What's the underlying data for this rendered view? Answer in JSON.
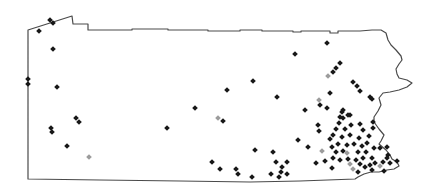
{
  "figure": {
    "type": "dot-distribution-map",
    "region_name": "pennsylvania",
    "background_color": "#ffffff",
    "outline_color": "#4a4a4a",
    "outline_stroke_width": 1.2,
    "marker_shape": "diamond",
    "marker_size": 5.6,
    "marker_colors": {
      "b": "#171717",
      "g": "#9c9c9c"
    },
    "outline": [
      [
        28,
        30
      ],
      [
        72,
        16
      ],
      [
        73,
        24
      ],
      [
        88,
        24
      ],
      [
        88,
        30
      ],
      [
        132,
        30
      ],
      [
        132,
        29
      ],
      [
        168,
        29
      ],
      [
        168,
        30
      ],
      [
        208,
        30
      ],
      [
        208,
        31
      ],
      [
        240,
        31
      ],
      [
        240,
        30
      ],
      [
        262,
        30
      ],
      [
        262,
        31
      ],
      [
        293,
        31
      ],
      [
        293,
        32
      ],
      [
        301,
        32
      ],
      [
        301,
        31
      ],
      [
        330,
        31
      ],
      [
        330,
        33
      ],
      [
        338,
        33
      ],
      [
        338,
        31
      ],
      [
        360,
        31
      ],
      [
        372,
        30
      ],
      [
        381,
        30
      ],
      [
        386,
        33
      ],
      [
        388,
        40
      ],
      [
        391,
        45
      ],
      [
        396,
        50
      ],
      [
        401,
        56
      ],
      [
        402,
        60
      ],
      [
        399,
        64
      ],
      [
        396,
        69
      ],
      [
        397,
        74
      ],
      [
        399,
        78
      ],
      [
        407,
        80
      ],
      [
        412,
        83
      ],
      [
        407,
        87
      ],
      [
        399,
        90
      ],
      [
        390,
        92
      ],
      [
        383,
        93
      ],
      [
        379,
        98
      ],
      [
        381,
        105
      ],
      [
        378,
        111
      ],
      [
        374,
        117
      ],
      [
        374,
        122
      ],
      [
        379,
        129
      ],
      [
        384,
        135
      ],
      [
        381,
        141
      ],
      [
        379,
        144
      ],
      [
        386,
        150
      ],
      [
        390,
        155
      ],
      [
        392,
        159
      ],
      [
        397,
        162
      ],
      [
        399,
        166
      ],
      [
        394,
        169
      ],
      [
        387,
        170
      ],
      [
        379,
        172
      ],
      [
        371,
        172
      ],
      [
        364,
        174
      ],
      [
        358,
        177
      ],
      [
        355,
        179
      ],
      [
        300,
        181
      ],
      [
        250,
        182
      ],
      [
        180,
        181
      ],
      [
        100,
        180
      ],
      [
        28,
        179
      ]
    ],
    "markers": [
      [
        50,
        20,
        "b"
      ],
      [
        53,
        23,
        "b"
      ],
      [
        39,
        31,
        "b"
      ],
      [
        53,
        49,
        "b"
      ],
      [
        28,
        79,
        "b"
      ],
      [
        28,
        84,
        "b"
      ],
      [
        57,
        87,
        "b"
      ],
      [
        76,
        118,
        "b"
      ],
      [
        79,
        122,
        "b"
      ],
      [
        51,
        128,
        "b"
      ],
      [
        52,
        132,
        "b"
      ],
      [
        67,
        146,
        "b"
      ],
      [
        89,
        157,
        "g"
      ],
      [
        227,
        90,
        "b"
      ],
      [
        253,
        81,
        "b"
      ],
      [
        277,
        97,
        "b"
      ],
      [
        295,
        54,
        "b"
      ],
      [
        327,
        43,
        "b"
      ],
      [
        330,
        93,
        "b"
      ],
      [
        167,
        128,
        "b"
      ],
      [
        195,
        108,
        "b"
      ],
      [
        218,
        118,
        "g"
      ],
      [
        223,
        121,
        "b"
      ],
      [
        212,
        162,
        "b"
      ],
      [
        220,
        169,
        "b"
      ],
      [
        255,
        150,
        "b"
      ],
      [
        273,
        152,
        "b"
      ],
      [
        276,
        162,
        "b"
      ],
      [
        287,
        162,
        "b"
      ],
      [
        282,
        167,
        "b"
      ],
      [
        271,
        174,
        "b"
      ],
      [
        281,
        172,
        "b"
      ],
      [
        287,
        174,
        "b"
      ],
      [
        279,
        177,
        "b"
      ],
      [
        236,
        169,
        "b"
      ],
      [
        238,
        174,
        "b"
      ],
      [
        252,
        177,
        "b"
      ],
      [
        298,
        140,
        "b"
      ],
      [
        308,
        147,
        "b"
      ],
      [
        305,
        110,
        "b"
      ],
      [
        316,
        163,
        "b"
      ],
      [
        340,
        63,
        "b"
      ],
      [
        336,
        68,
        "b"
      ],
      [
        333,
        72,
        "b"
      ],
      [
        328,
        76,
        "g"
      ],
      [
        353,
        82,
        "b"
      ],
      [
        357,
        86,
        "b"
      ],
      [
        360,
        91,
        "b"
      ],
      [
        370,
        97,
        "b"
      ],
      [
        372,
        99,
        "b"
      ],
      [
        343,
        110,
        "b"
      ],
      [
        350,
        115,
        "b"
      ],
      [
        340,
        117,
        "b"
      ],
      [
        319,
        100,
        "g"
      ],
      [
        320,
        105,
        "b"
      ],
      [
        327,
        108,
        "b"
      ],
      [
        318,
        125,
        "b"
      ],
      [
        319,
        131,
        "b"
      ],
      [
        322,
        151,
        "g"
      ],
      [
        325,
        161,
        "b"
      ],
      [
        332,
        168,
        "b"
      ],
      [
        342,
        112,
        "b"
      ],
      [
        343,
        118,
        "b"
      ],
      [
        348,
        115,
        "b"
      ],
      [
        339,
        123,
        "b"
      ],
      [
        351,
        125,
        "b"
      ],
      [
        360,
        124,
        "b"
      ],
      [
        336,
        129,
        "b"
      ],
      [
        345,
        129,
        "b"
      ],
      [
        363,
        130,
        "b"
      ],
      [
        373,
        128,
        "b"
      ],
      [
        373,
        122,
        "b"
      ],
      [
        333,
        135,
        "b"
      ],
      [
        330,
        139,
        "b"
      ],
      [
        342,
        137,
        "b"
      ],
      [
        350,
        135,
        "b"
      ],
      [
        359,
        138,
        "b"
      ],
      [
        369,
        136,
        "b"
      ],
      [
        338,
        144,
        "b"
      ],
      [
        332,
        147,
        "b"
      ],
      [
        347,
        145,
        "b"
      ],
      [
        354,
        144,
        "b"
      ],
      [
        362,
        146,
        "b"
      ],
      [
        367,
        143,
        "b"
      ],
      [
        374,
        148,
        "b"
      ],
      [
        380,
        148,
        "b"
      ],
      [
        387,
        147,
        "b"
      ],
      [
        336,
        152,
        "b"
      ],
      [
        343,
        151,
        "b"
      ],
      [
        347,
        153,
        "g"
      ],
      [
        358,
        152,
        "b"
      ],
      [
        366,
        152,
        "b"
      ],
      [
        388,
        155,
        "b"
      ],
      [
        333,
        158,
        "b"
      ],
      [
        340,
        160,
        "b"
      ],
      [
        348,
        159,
        "b"
      ],
      [
        356,
        160,
        "b"
      ],
      [
        363,
        158,
        "b"
      ],
      [
        372,
        158,
        "b"
      ],
      [
        387,
        158,
        "b"
      ],
      [
        350,
        164,
        "g"
      ],
      [
        360,
        164,
        "b"
      ],
      [
        365,
        167,
        "b"
      ],
      [
        370,
        165,
        "b"
      ],
      [
        375,
        163,
        "b"
      ],
      [
        383,
        162,
        "b"
      ],
      [
        353,
        169,
        "g"
      ],
      [
        358,
        172,
        "b"
      ],
      [
        380,
        166,
        "g"
      ],
      [
        372,
        170,
        "b"
      ],
      [
        384,
        171,
        "b"
      ],
      [
        390,
        163,
        "b"
      ],
      [
        397,
        161,
        "b"
      ]
    ]
  }
}
